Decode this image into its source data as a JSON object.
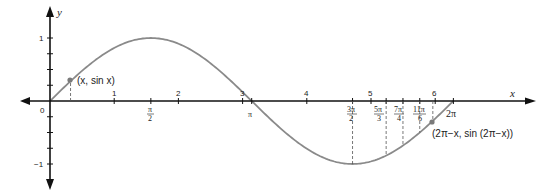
{
  "diagram": {
    "axes": {
      "x_label": "x",
      "y_label": "y",
      "origin_label": "0",
      "x_numeric_ticks": [
        "1",
        "2",
        "3",
        "4",
        "5",
        "6"
      ],
      "y_ticks": [
        "1",
        "−1"
      ]
    },
    "pi_ticks": {
      "pi_over_2": {
        "num": "π",
        "den": "2"
      },
      "pi": "π",
      "three_pi_over_2": {
        "num": "3π",
        "den": "2"
      },
      "five_pi_over_3": {
        "num": "5π",
        "den": "3"
      },
      "seven_pi_over_4": {
        "num": "7π",
        "den": "4"
      },
      "eleven_pi_over_6": {
        "num": "11π",
        "den": "6"
      },
      "two_pi": "2π"
    },
    "points": {
      "p1": "(x, sin x)",
      "p2": "(2π−x, sin (2π−x))"
    },
    "colors": {
      "axis": "#111111",
      "curve": "#8a8a8a",
      "dashed": "#555555",
      "point": "#7a7a7a"
    }
  }
}
